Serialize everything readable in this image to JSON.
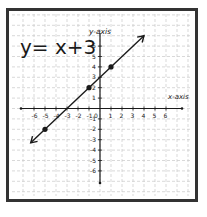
{
  "equation": "y= x+3",
  "axes": {
    "x_label": "x-axis",
    "y_label": "y-axis",
    "x_ticks": [
      "-6",
      "-5",
      "-4",
      "-3",
      "-2",
      "-1",
      "0",
      "1",
      "2",
      "3",
      "4",
      "5",
      "6"
    ],
    "y_ticks": [
      "-6",
      "-5",
      "-4",
      "-3",
      "-2",
      "-1",
      "1",
      "2",
      "3",
      "4",
      "5",
      "6"
    ]
  },
  "colors": {
    "frame": "#333333",
    "grid": "#c8c8c8",
    "ink": "#1a1a1a",
    "background": "#ffffff"
  },
  "chart_data": {
    "type": "line",
    "title": "y= x+3",
    "xlabel": "x-axis",
    "ylabel": "y-axis",
    "xlim": [
      -7,
      7
    ],
    "ylim": [
      -8,
      8
    ],
    "grid": true,
    "series": [
      {
        "name": "y = x + 3",
        "x": [
          -6.3,
          4
        ],
        "y": [
          -3.3,
          7
        ],
        "arrows": "both"
      }
    ],
    "points": [
      {
        "x": -5,
        "y": -2
      },
      {
        "x": -1,
        "y": 2
      },
      {
        "x": 1,
        "y": 4
      }
    ]
  }
}
